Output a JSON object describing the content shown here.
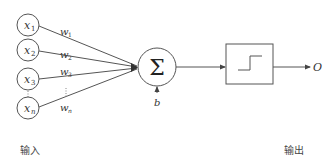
{
  "diagram": {
    "inputs": [
      {
        "label": "x",
        "sub": "1",
        "weight": "w",
        "weight_sub": "1",
        "cy": 25
      },
      {
        "label": "x",
        "sub": "2",
        "weight": "w",
        "weight_sub": "2",
        "cy": 50
      },
      {
        "label": "x",
        "sub": "3",
        "weight": "w",
        "weight_sub": "3",
        "cy": 79
      },
      {
        "label": "x",
        "sub": "n",
        "weight": "w",
        "weight_sub": "n",
        "cy": 108
      }
    ],
    "ellipsis": "⋮",
    "summation": {
      "symbol": "Σ"
    },
    "bias": {
      "label": "b"
    },
    "activation": {
      "type": "step-function-icon"
    },
    "output": {
      "label": "O"
    },
    "captions": {
      "input": "输入",
      "output": "输出"
    },
    "colors": {
      "stroke": "#555555",
      "text": "#333333",
      "background": "#ffffff"
    }
  }
}
